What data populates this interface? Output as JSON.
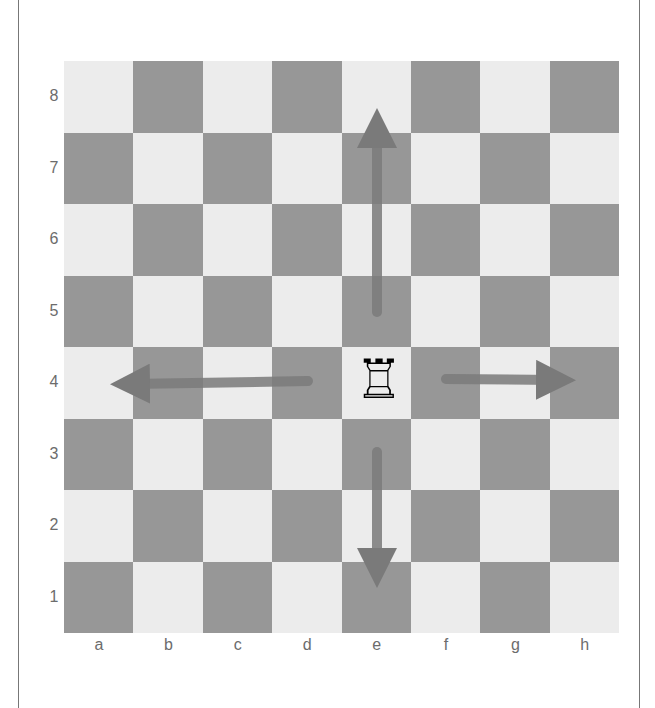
{
  "diagram": {
    "type": "chess-move-diagram",
    "piece": {
      "name": "white rook",
      "symbol": "♖",
      "square": "e4"
    },
    "ranks": [
      "8",
      "7",
      "6",
      "5",
      "4",
      "3",
      "2",
      "1"
    ],
    "files": [
      "a",
      "b",
      "c",
      "d",
      "e",
      "f",
      "g",
      "h"
    ],
    "arrows": [
      {
        "direction": "up",
        "from": "e5",
        "to": "e8"
      },
      {
        "direction": "left",
        "from": "d4",
        "to": "a4"
      },
      {
        "direction": "right",
        "from": "f4",
        "to": "h4"
      },
      {
        "direction": "down",
        "from": "e3",
        "to": "e1"
      }
    ],
    "colors": {
      "light_square": "#ececec",
      "dark_square": "#979797",
      "arrow": "#7a7a7a",
      "label": "#6c6c6c"
    }
  }
}
